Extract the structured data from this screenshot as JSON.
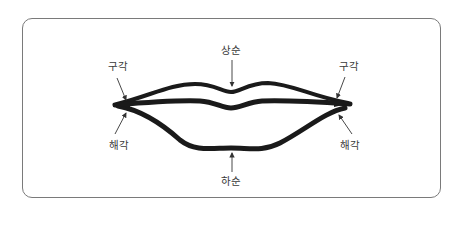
{
  "diagram": {
    "labels": {
      "upper_lip": "상순",
      "lower_lip": "하순",
      "mouth_corner_left": "구각",
      "mouth_corner_right": "구각",
      "lower_corner_left": "해각",
      "lower_corner_right": "해각"
    },
    "colors": {
      "line": "#1a1a1a",
      "frame": "#7a7a7a",
      "text": "#3a3a3a"
    }
  }
}
